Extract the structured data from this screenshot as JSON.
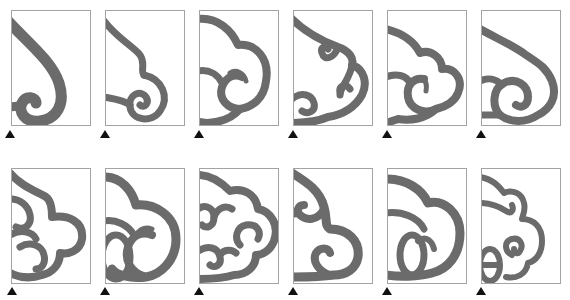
{
  "figure": {
    "description": "Grid of 12 cloud-scroll ornament motifs, each cropped in a rectangular frame with a triangle marker at the bottom-left",
    "stroke_color": "#6b6b6b",
    "frame_color": "#a3a3a3",
    "marker_color": "#111111",
    "marker_icon": "triangle-up-icon",
    "rows": [
      {
        "panels": [
          {
            "id": 1,
            "motif": "single-spiral-hook"
          },
          {
            "id": 2,
            "motif": "s-curve-with-spiral"
          },
          {
            "id": 3,
            "motif": "two-lobe-cloud-with-hook"
          },
          {
            "id": 4,
            "motif": "cloud-with-twin-inner-curls"
          },
          {
            "id": 5,
            "motif": "three-lobe-cloud-with-hook"
          },
          {
            "id": 6,
            "motif": "cloud-with-spiral"
          }
        ]
      },
      {
        "panels": [
          {
            "id": 7,
            "motif": "cloud-with-nested-curls"
          },
          {
            "id": 8,
            "motif": "large-lobe-with-interlocked-rings"
          },
          {
            "id": 9,
            "motif": "four-lobe-cloud-with-interlaced-curls"
          },
          {
            "id": 10,
            "motif": "cloud-with-opposing-hooks"
          },
          {
            "id": 11,
            "motif": "broad-cloud-with-interlocked-rings"
          },
          {
            "id": 12,
            "motif": "layered-cloud-with-spiral-and-rings"
          }
        ]
      }
    ]
  }
}
